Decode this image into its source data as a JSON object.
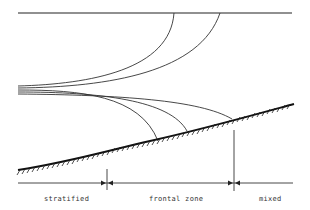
{
  "diagram": {
    "zones": [
      {
        "label": "stratified"
      },
      {
        "label": "frontal zone"
      },
      {
        "label": "mixed"
      }
    ],
    "colors": {
      "line": "#222222",
      "background": "#ffffff"
    }
  }
}
